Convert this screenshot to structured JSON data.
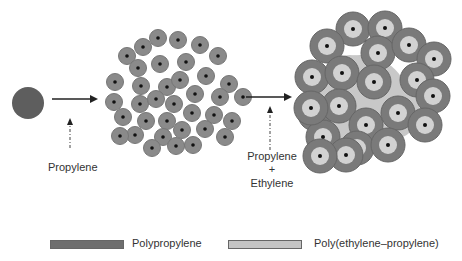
{
  "labels": {
    "step1": "Propylene",
    "step2_line1": "Propylene",
    "step2_plus": "+",
    "step2_line2": "Ethylene"
  },
  "legend": [
    {
      "label": "Polypropylene",
      "color": "#6e6e6e"
    },
    {
      "label": "Poly(ethylene–propylene)",
      "color": "#c4c4c4"
    }
  ],
  "colors": {
    "catalyst": "#5e5e5e",
    "pp_particle": "#8a8a8a",
    "pp_ring": "#7a7a7a",
    "epr": "#c8c8c8",
    "core": "#111111",
    "arrow": "#222222"
  }
}
